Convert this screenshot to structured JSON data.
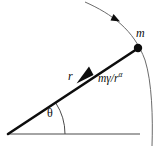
{
  "figure": {
    "type": "physics-force-diagram",
    "width": 167,
    "height": 149,
    "background_color": "#ffffff",
    "stroke_color": "#0d0d0d",
    "thin_stroke_color": "#555555"
  },
  "labels": {
    "mass": "m",
    "radius": "r",
    "force_base": "mγ/r",
    "force_exponent": "α",
    "force_full": "mγ/rα",
    "angle": "θ"
  },
  "geometry": {
    "origin": {
      "x": 8,
      "y": 134
    },
    "particle": {
      "x": 138,
      "y": 48
    },
    "baseline_end": {
      "x": 140,
      "y": 134
    },
    "angle_arc_radius": 57,
    "angle_degrees": 33,
    "trajectory_start": {
      "x": 85,
      "y": 2
    },
    "trajectory_end": {
      "x": 152,
      "y": 146
    },
    "force_arrow_tip": {
      "x": 78,
      "y": 82
    },
    "trajectory_arrow_at": {
      "x": 112,
      "y": 18
    },
    "particle_dot_radius": 4.2
  },
  "elements": {
    "radius_line_name": "radius-vector-line",
    "force_arrow_name": "central-force-arrow",
    "trajectory_name": "trajectory-curve",
    "baseline_name": "horizontal-axis-line",
    "angle_arc_name": "angle-arc"
  }
}
